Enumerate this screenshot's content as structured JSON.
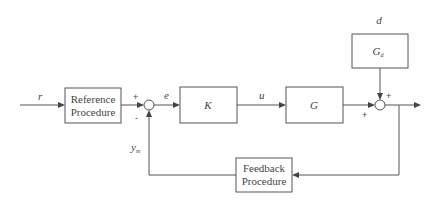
{
  "diagram": {
    "type": "block-diagram",
    "signals": {
      "reference": "r",
      "error": "e",
      "control": "u",
      "disturbance": "d",
      "measured": {
        "base": "y",
        "sub": "m"
      }
    },
    "blocks": {
      "reference_procedure": {
        "line1": "Reference",
        "line2": "Procedure"
      },
      "controller": "K",
      "plant": "G",
      "disturbance_model": {
        "base": "G",
        "sub": "d"
      },
      "feedback_procedure": {
        "line1": "Feedback",
        "line2": "Procedure"
      }
    },
    "signs": {
      "sum1_plus": "+",
      "sum1_minus": "-",
      "sum2_plus_left": "+",
      "sum2_plus_top": "+"
    },
    "colors": {
      "stroke": "#555555",
      "text": "#444444",
      "background": "#ffffff"
    }
  }
}
